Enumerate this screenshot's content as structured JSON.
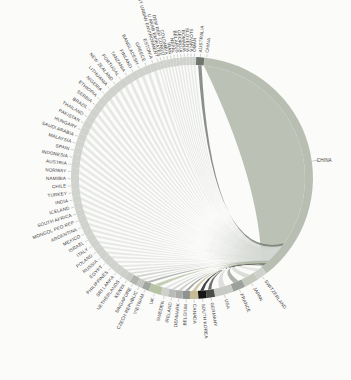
{
  "figure": {
    "background_color": "#fbfbfa",
    "label_color": "#3b3b3b",
    "leader_line_color": "#9a9a9a"
  },
  "chart_data": {
    "type": "chord",
    "title": "",
    "dominant_node": "CHINA",
    "layout": {
      "center": {
        "cx": 192,
        "cy": 178
      },
      "radius": {
        "inner": 113,
        "outer": 121,
        "label": 126
      },
      "china_arc": {
        "start_deg": 84,
        "end_deg": -52
      },
      "ribbon_convergence_control": [
        212,
        262
      ],
      "ribbon_target_range_deg": [
        -50,
        -36
      ],
      "legend": "none",
      "grid": "off"
    },
    "colors": {
      "china": "#b9beb3",
      "default_node": "#cfd2cd",
      "default_ribbon": "#d6d8d3"
    },
    "china": {
      "label": "CHINA",
      "arc_span_deg": 136,
      "right_label_angle_deg": 8,
      "top_label_angle_deg": 83,
      "color": "#b9beb3"
    },
    "nodes_clockwise_from_china_end": [
      {
        "label": "SWITZERLAND",
        "span_deg": 5.0,
        "color": "#cfd2cd"
      },
      {
        "label": "JAPAN",
        "span_deg": 7.0,
        "color": "#c3c9bc"
      },
      {
        "label": "FRANCE",
        "span_deg": 6.0,
        "color": "#9ca19b"
      },
      {
        "label": "USA",
        "span_deg": 9.0,
        "color": "#c7cac5"
      },
      {
        "label": "GERMANY",
        "span_deg": 4.0,
        "color": "#4a4d4a"
      },
      {
        "label": "SOUTH KOREA",
        "span_deg": 4.0,
        "color": "#161616"
      },
      {
        "label": "CANADA",
        "span_deg": 4.0,
        "color": "#c6bd96"
      },
      {
        "label": "BELGIUM",
        "span_deg": 3.5,
        "color": "#8f938e"
      },
      {
        "label": "DENMARK",
        "span_deg": 3.5,
        "color": "#a9aca8"
      },
      {
        "label": "IRELAND",
        "span_deg": 3.5,
        "color": "#b8bbb6"
      },
      {
        "label": "SWEDEN",
        "span_deg": 3.5,
        "color": "#cdd0cb"
      },
      {
        "label": "UK",
        "span_deg": 6.0,
        "color": "#b7c4a4"
      },
      {
        "label": "VIETNAM",
        "span_deg": 3.5,
        "color": "#a0a5a0"
      },
      {
        "label": "CZECH REPUBLIC",
        "span_deg": 3.0,
        "color": "#c2c5c0"
      },
      {
        "label": "SINGAPORE",
        "span_deg": 3.5,
        "color": "#b0b5ae"
      },
      {
        "label": "KENYA",
        "span_deg": 3.0,
        "color": "#c8cbc6"
      },
      {
        "label": "NETHERLANDS",
        "span_deg": 3.0,
        "color": "#cdcfca"
      },
      {
        "label": "SRI LANKA",
        "span_deg": 3.4
      },
      {
        "label": "PHILIPPINES",
        "span_deg": 3.4
      },
      {
        "label": "EGYPT",
        "span_deg": 3.4
      },
      {
        "label": "RUSSIA",
        "span_deg": 3.4
      },
      {
        "label": "POLAND",
        "span_deg": 3.4
      },
      {
        "label": "ITALY",
        "span_deg": 3.4
      },
      {
        "label": "ISRAEL",
        "span_deg": 3.4
      },
      {
        "label": "MEXICO",
        "span_deg": 3.4
      },
      {
        "label": "ARGENTINA",
        "span_deg": 3.4
      },
      {
        "label": "MONGOL PEO REP",
        "span_deg": 3.4
      },
      {
        "label": "SOUTH AFRICA",
        "span_deg": 3.4
      },
      {
        "label": "ICELAND",
        "span_deg": 3.4
      },
      {
        "label": "INDIA",
        "span_deg": 3.4
      },
      {
        "label": "TURKEY",
        "span_deg": 3.4
      },
      {
        "label": "CHILE",
        "span_deg": 3.4
      },
      {
        "label": "NAMIBIA",
        "span_deg": 3.4
      },
      {
        "label": "NORWAY",
        "span_deg": 3.4
      },
      {
        "label": "AUSTRIA",
        "span_deg": 3.4
      },
      {
        "label": "INDONESIA",
        "span_deg": 3.4
      },
      {
        "label": "SPAIN",
        "span_deg": 3.4
      },
      {
        "label": "MALAYSIA",
        "span_deg": 3.4
      },
      {
        "label": "SAUDI ARABIA",
        "span_deg": 3.4
      },
      {
        "label": "HUNGARY",
        "span_deg": 3.4
      },
      {
        "label": "PAKISTAN",
        "span_deg": 3.4
      },
      {
        "label": "THAILAND",
        "span_deg": 3.4
      },
      {
        "label": "BRAZIL",
        "span_deg": 3.4
      },
      {
        "label": "SERBIA",
        "span_deg": 3.4
      },
      {
        "label": "ETHIOPIA",
        "span_deg": 3.4
      },
      {
        "label": "NIGERIA",
        "span_deg": 3.4
      },
      {
        "label": "LITHUANIA",
        "span_deg": 3.4
      },
      {
        "label": "NEW ZEALAND",
        "span_deg": 3.4
      },
      {
        "label": "PORTUGAL",
        "span_deg": 3.4
      },
      {
        "label": "TANZANIA",
        "span_deg": 3.4
      },
      {
        "label": "FINLAND",
        "span_deg": 3.4
      },
      {
        "label": "BANGLADESH",
        "span_deg": 3.4
      },
      {
        "label": "GREECE",
        "span_deg": 3.4
      },
      {
        "label": "ESTONIA",
        "span_deg": 3.4
      },
      {
        "label": "INST URBAN ENVIRONMENT",
        "span_deg": 1.6
      },
      {
        "label": "U ARAB EMIRATES",
        "span_deg": 1.6
      },
      {
        "label": "DEM REP CONGO",
        "span_deg": 1.6
      },
      {
        "label": "COLOMBIA",
        "span_deg": 1.6
      },
      {
        "label": "IRAN",
        "span_deg": 1.6
      },
      {
        "label": "NEPAL",
        "span_deg": 1.6
      },
      {
        "label": "BELARUS",
        "span_deg": 1.6
      },
      {
        "label": "GEORGIA",
        "span_deg": 1.6
      },
      {
        "label": "ROMANIA",
        "span_deg": 1.6
      },
      {
        "label": "SLOVENIA",
        "span_deg": 1.6
      },
      {
        "label": "SLOVAKIA",
        "span_deg": 1.6
      },
      {
        "label": "OMAN",
        "span_deg": 1.6
      },
      {
        "label": "AUSTRALIA",
        "span_deg": 3.9,
        "color": "#717570"
      }
    ]
  }
}
